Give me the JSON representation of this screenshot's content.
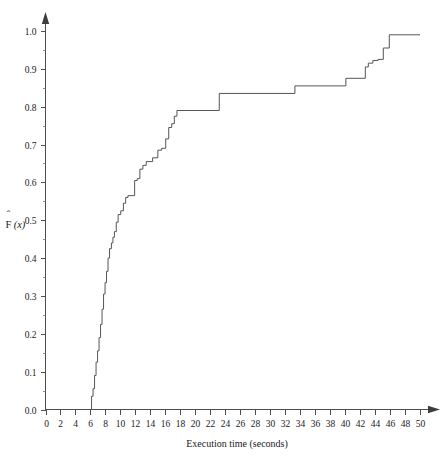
{
  "chart_data": {
    "type": "line",
    "subtype": "empirical-cdf-step",
    "title": "",
    "xlabel": "Execution time (seconds)",
    "ylabel": "F̂(x)",
    "ylabel_parts": {
      "base": "F",
      "accent": "ˆ",
      "arg": "(x)"
    },
    "xlim": [
      0,
      50
    ],
    "ylim": [
      0.0,
      1.0
    ],
    "grid": false,
    "legend": null,
    "x_ticks": [
      0,
      2,
      4,
      6,
      8,
      10,
      12,
      14,
      16,
      18,
      20,
      22,
      24,
      26,
      28,
      30,
      32,
      34,
      36,
      38,
      40,
      42,
      44,
      46,
      48,
      50
    ],
    "x_tick_labels": [
      "0",
      "2",
      "4",
      "6",
      "8",
      "10",
      "12",
      "14",
      "16",
      "18",
      "20",
      "22",
      "24",
      "26",
      "28",
      "30",
      "32",
      "34",
      "36",
      "38",
      "40",
      "42",
      "44",
      "46",
      "48",
      "50"
    ],
    "x_minor_step": 1,
    "y_ticks": [
      0.0,
      0.1,
      0.2,
      0.3,
      0.4,
      0.5,
      0.6,
      0.7,
      0.8,
      0.9,
      1.0
    ],
    "y_tick_labels": [
      "0.0",
      "0.1",
      "0.2",
      "0.3",
      "0.4",
      "0.5",
      "0.6",
      "0.7",
      "0.8",
      "0.9",
      "1.0"
    ],
    "y_minor_step": 0.05,
    "series_color": "#555555",
    "axis_color": "#4d4d4d",
    "x": [
      6.0,
      6.15,
      6.3,
      6.5,
      6.7,
      6.9,
      7.1,
      7.3,
      7.5,
      7.7,
      7.9,
      8.1,
      8.3,
      8.5,
      8.7,
      8.9,
      9.1,
      9.3,
      9.5,
      9.8,
      10.1,
      10.4,
      10.7,
      11.0,
      11.4,
      11.8,
      12.2,
      12.6,
      13.0,
      13.6,
      14.2,
      14.8,
      15.4,
      16.0,
      16.4,
      16.8,
      17.2,
      17.6,
      23.2,
      33.3,
      40.0,
      42.6,
      43.0,
      43.6,
      44.2,
      44.8,
      45.3,
      46.0,
      50.0
    ],
    "y": [
      0.0,
      0.035,
      0.055,
      0.09,
      0.125,
      0.155,
      0.19,
      0.225,
      0.265,
      0.305,
      0.335,
      0.365,
      0.395,
      0.425,
      0.44,
      0.455,
      0.47,
      0.495,
      0.515,
      0.525,
      0.545,
      0.56,
      0.565,
      0.565,
      0.605,
      0.61,
      0.635,
      0.645,
      0.655,
      0.665,
      0.685,
      0.69,
      0.715,
      0.745,
      0.755,
      0.775,
      0.785,
      0.79,
      0.835,
      0.855,
      0.875,
      0.877,
      0.905,
      0.915,
      0.922,
      0.925,
      0.955,
      0.99,
      0.99
    ],
    "steps": [
      {
        "x": 6.0,
        "y": 0.0
      },
      {
        "x": 6.15,
        "y": 0.035
      },
      {
        "x": 6.35,
        "y": 0.055
      },
      {
        "x": 6.55,
        "y": 0.09
      },
      {
        "x": 6.75,
        "y": 0.125
      },
      {
        "x": 6.95,
        "y": 0.155
      },
      {
        "x": 7.15,
        "y": 0.19
      },
      {
        "x": 7.35,
        "y": 0.225
      },
      {
        "x": 7.55,
        "y": 0.265
      },
      {
        "x": 7.75,
        "y": 0.305
      },
      {
        "x": 7.95,
        "y": 0.335
      },
      {
        "x": 8.15,
        "y": 0.365
      },
      {
        "x": 8.35,
        "y": 0.4
      },
      {
        "x": 8.55,
        "y": 0.425
      },
      {
        "x": 8.8,
        "y": 0.44
      },
      {
        "x": 9.0,
        "y": 0.455
      },
      {
        "x": 9.2,
        "y": 0.47
      },
      {
        "x": 9.45,
        "y": 0.495
      },
      {
        "x": 9.7,
        "y": 0.515
      },
      {
        "x": 10.05,
        "y": 0.525
      },
      {
        "x": 10.4,
        "y": 0.545
      },
      {
        "x": 10.7,
        "y": 0.56
      },
      {
        "x": 11.0,
        "y": 0.565
      },
      {
        "x": 11.9,
        "y": 0.605
      },
      {
        "x": 12.25,
        "y": 0.61
      },
      {
        "x": 12.6,
        "y": 0.635
      },
      {
        "x": 13.0,
        "y": 0.645
      },
      {
        "x": 13.45,
        "y": 0.655
      },
      {
        "x": 14.3,
        "y": 0.665
      },
      {
        "x": 15.0,
        "y": 0.685
      },
      {
        "x": 15.5,
        "y": 0.69
      },
      {
        "x": 16.05,
        "y": 0.715
      },
      {
        "x": 16.45,
        "y": 0.745
      },
      {
        "x": 16.85,
        "y": 0.755
      },
      {
        "x": 17.2,
        "y": 0.775
      },
      {
        "x": 17.55,
        "y": 0.79
      },
      {
        "x": 23.2,
        "y": 0.835
      },
      {
        "x": 33.3,
        "y": 0.855
      },
      {
        "x": 40.1,
        "y": 0.875
      },
      {
        "x": 42.7,
        "y": 0.905
      },
      {
        "x": 43.1,
        "y": 0.915
      },
      {
        "x": 43.7,
        "y": 0.922
      },
      {
        "x": 44.4,
        "y": 0.925
      },
      {
        "x": 45.1,
        "y": 0.955
      },
      {
        "x": 45.9,
        "y": 0.99
      },
      {
        "x": 50.0,
        "y": 0.99
      }
    ],
    "annotations": []
  },
  "axes": {
    "x_title": "Execution time (seconds)",
    "y_title": "F̂(x)"
  }
}
